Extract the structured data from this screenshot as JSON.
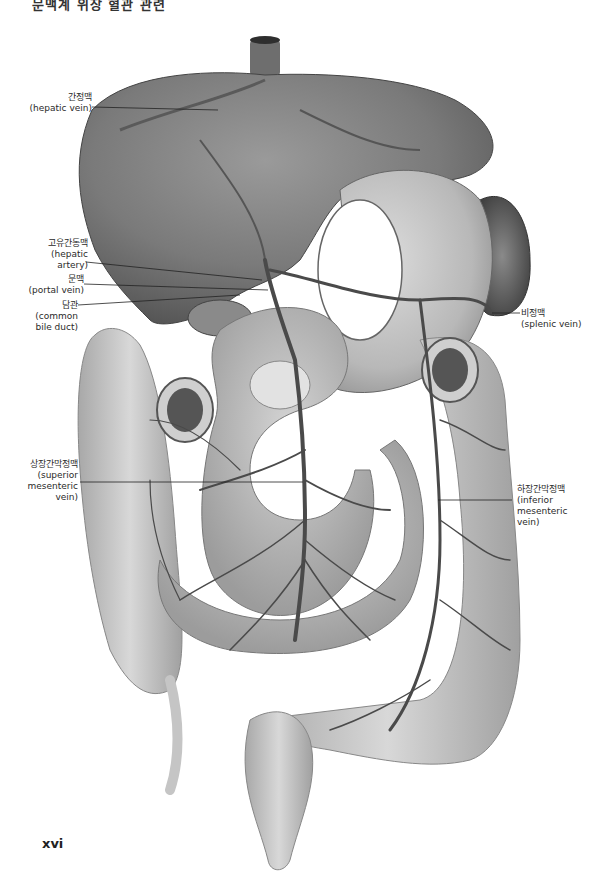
{
  "page": {
    "header_partial": "문맥계 위장 혈관 관련",
    "page_number": "xvi"
  },
  "figure": {
    "type": "anatomical illustration (grayscale)",
    "labels": [
      {
        "id": "hepatic-vein",
        "ko": "간정맥",
        "en": "(hepatic vein)"
      },
      {
        "id": "hepatic-artery",
        "ko": "고유간동맥",
        "en_lines": [
          "(hepatic",
          "artery)"
        ]
      },
      {
        "id": "portal-vein",
        "ko": "문맥",
        "en": "(portal vein)"
      },
      {
        "id": "common-bile-duct",
        "ko": "담관",
        "en_lines": [
          "(common",
          "bile duct)"
        ]
      },
      {
        "id": "splenic-vein",
        "ko": "비정맥",
        "en": "(splenic vein)"
      },
      {
        "id": "superior-mesenteric-vein",
        "ko": "상장간막정맥",
        "en_lines": [
          "(superior",
          "mesenteric",
          "vein)"
        ]
      },
      {
        "id": "inferior-mesenteric-vein",
        "ko": "하장간막정맥",
        "en_lines": [
          "(inferior",
          "mesenteric",
          "vein)"
        ]
      }
    ]
  }
}
